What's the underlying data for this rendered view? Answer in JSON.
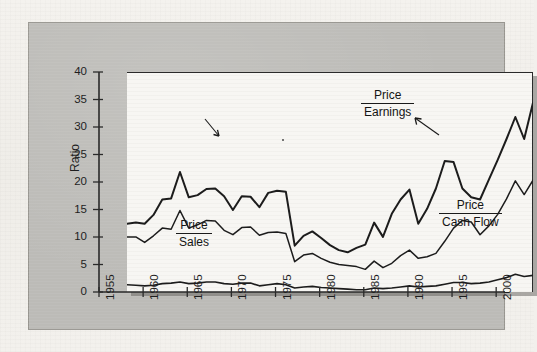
{
  "figure": {
    "y_axis_title": "Ratio",
    "y_ticks": [
      "0",
      "5",
      "10",
      "15",
      "20",
      "25",
      "30",
      "35",
      "40"
    ],
    "x_ticks": [
      "1955",
      "1960",
      "1965",
      "1970",
      "1975",
      "1980",
      "1985",
      "1990",
      "1995",
      "2000"
    ],
    "annotations": {
      "pe": {
        "numerator": "Price",
        "denominator": "Earnings"
      },
      "pcf": {
        "numerator": "Price",
        "denominator": "Cash Flow"
      },
      "ps": {
        "numerator": "Price",
        "denominator": "Sales"
      }
    },
    "colors": {
      "mount_gray": "#bcbbb7",
      "plot_background": "#f7f6f3",
      "line": "#1c1c1c",
      "page": "#f2f0ec"
    }
  },
  "chart_data": {
    "type": "line",
    "title": "",
    "xlabel": "",
    "ylabel": "Ratio",
    "xlim": [
      1955,
      2001
    ],
    "ylim": [
      0,
      40
    ],
    "grid": false,
    "legend": "inline-annotations",
    "x": [
      1955,
      1956,
      1957,
      1958,
      1959,
      1960,
      1961,
      1962,
      1963,
      1964,
      1965,
      1966,
      1967,
      1968,
      1969,
      1970,
      1971,
      1972,
      1973,
      1974,
      1975,
      1976,
      1977,
      1978,
      1979,
      1980,
      1981,
      1982,
      1983,
      1984,
      1985,
      1986,
      1987,
      1988,
      1989,
      1990,
      1991,
      1992,
      1993,
      1994,
      1995,
      1996,
      1997,
      1998,
      1999,
      2000,
      2001
    ],
    "series": [
      {
        "name": "Price/Earnings",
        "values": [
          12.6,
          12.8,
          12.6,
          14.2,
          17.0,
          17.2,
          22.0,
          17.4,
          17.8,
          18.9,
          19.0,
          17.6,
          15.1,
          17.6,
          17.5,
          15.6,
          18.2,
          18.6,
          18.4,
          8.6,
          10.4,
          11.2,
          10.0,
          8.7,
          7.8,
          7.4,
          8.2,
          8.8,
          12.8,
          10.2,
          14.4,
          17.0,
          18.8,
          12.6,
          15.3,
          19.0,
          24.0,
          23.8,
          19.0,
          17.4,
          17.0,
          20.6,
          24.2,
          28.0,
          32.0,
          28.0,
          34.6
        ]
      },
      {
        "name": "Price/Cash Flow",
        "values": [
          10.2,
          10.2,
          9.2,
          10.4,
          11.8,
          11.6,
          15.0,
          11.8,
          12.4,
          13.2,
          13.1,
          11.4,
          10.6,
          11.9,
          12.0,
          10.5,
          11.0,
          11.1,
          10.8,
          5.7,
          6.9,
          7.2,
          6.3,
          5.6,
          5.2,
          5.0,
          4.8,
          4.3,
          5.8,
          4.6,
          5.4,
          6.8,
          7.8,
          6.3,
          6.6,
          7.2,
          9.4,
          11.8,
          13.2,
          12.9,
          10.6,
          12.2,
          14.3,
          17.1,
          20.4,
          17.9,
          20.5
        ]
      },
      {
        "name": "Price/Sales",
        "values": [
          1.5,
          1.4,
          1.3,
          1.4,
          1.7,
          1.8,
          2.0,
          1.7,
          1.8,
          2.0,
          2.0,
          1.7,
          1.6,
          1.8,
          1.8,
          1.3,
          1.5,
          1.7,
          1.5,
          0.9,
          1.1,
          1.2,
          1.0,
          0.9,
          0.8,
          0.7,
          0.6,
          0.6,
          0.9,
          0.8,
          0.9,
          1.1,
          1.3,
          1.1,
          1.2,
          1.3,
          1.6,
          1.9,
          1.9,
          1.7,
          1.8,
          2.0,
          2.4,
          2.8,
          3.4,
          3.0,
          3.2
        ]
      }
    ]
  }
}
